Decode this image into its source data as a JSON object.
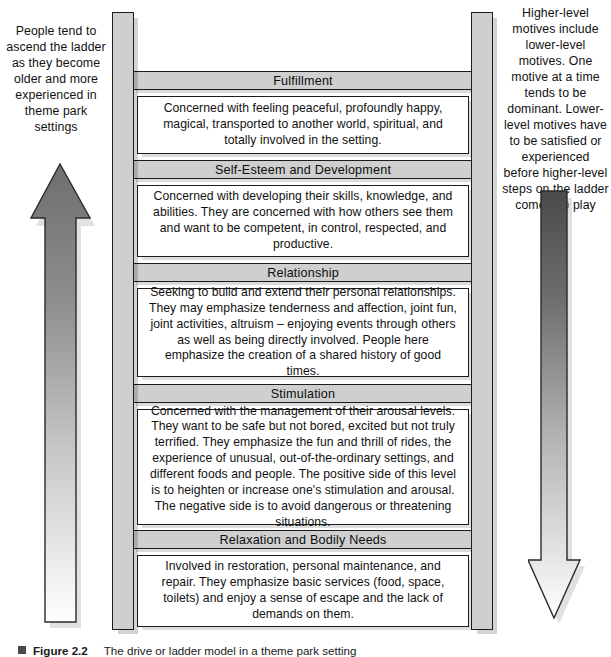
{
  "figure": {
    "label": "Figure 2.2",
    "title": "The drive or ladder model in a theme park setting"
  },
  "captions": {
    "left": "People tend to ascend the ladder as they become older and more experienced in theme park settings",
    "right": "Higher-level motives include lower-level motives. One motive at a time tends to be dominant. Lower-level motives have to be satisfied or experienced before higher-level steps on the ladder come into play"
  },
  "arrows": {
    "up": {
      "name": "upward-arrow",
      "direction": "up",
      "gradient_from": "#6e6e6e",
      "gradient_to": "#ffffff"
    },
    "down": {
      "name": "downward-arrow",
      "direction": "down",
      "gradient_from": "#4f4f4f",
      "gradient_to": "#ffffff"
    }
  },
  "colors": {
    "rail": "#cfcfcf",
    "rung": "#cfcfcf",
    "panel": "#ffffff",
    "outline": "#1c1c1c"
  },
  "ladder": {
    "levels": [
      {
        "id": "fulfillment",
        "title": "Fulfillment",
        "body": "Concerned with feeling peaceful, profoundly happy, magical, transported to another world, spiritual, and totally involved in the setting."
      },
      {
        "id": "self-esteem-and-development",
        "title": "Self-Esteem and Development",
        "body": "Concerned with developing their skills, knowledge, and abilities. They are concerned with how others see them and want to be competent, in control, respected, and productive."
      },
      {
        "id": "relationship",
        "title": "Relationship",
        "body": "Seeking to build and extend their personal relationships. They may emphasize tenderness and affection, joint fun, joint activities, altruism – enjoying events through others as well as being directly involved. People here emphasize the creation of a shared history of good times."
      },
      {
        "id": "stimulation",
        "title": "Stimulation",
        "body": "Concerned with the management of their arousal levels. They want to be safe but not bored, excited but not truly terrified. They emphasize the fun and thrill of rides, the experience of unusual, out-of-the-ordinary settings, and different foods and people. The positive side of this level is to heighten or increase one's stimulation and arousal. The negative side is to avoid dangerous or threatening situations."
      },
      {
        "id": "relaxation-and-bodily-needs",
        "title": "Relaxation and Bodily Needs",
        "body": "Involved in restoration, personal maintenance, and repair. They emphasize basic services (food, space, toilets) and enjoy a sense of escape and the lack of demands on them."
      }
    ]
  }
}
